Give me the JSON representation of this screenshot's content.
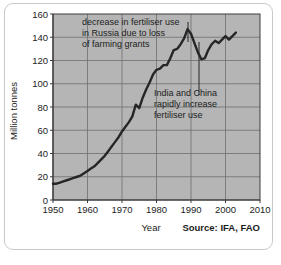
{
  "chart_data": {
    "type": "line",
    "title": "",
    "xlabel": "Year",
    "ylabel": "Million tonnes",
    "source": "Source: IFA, FAO",
    "xlim": [
      1950,
      2010
    ],
    "ylim": [
      0,
      160
    ],
    "grid": true,
    "legend": "none",
    "x_ticks": [
      "1950",
      "1960",
      "1970",
      "1980",
      "1990",
      "2000",
      "2010"
    ],
    "y_ticks": [
      "0",
      "20",
      "40",
      "60",
      "80",
      "100",
      "120",
      "140",
      "160"
    ],
    "series": [
      {
        "name": "World fertiliser use",
        "color": "#262626",
        "x": [
          1950,
          1951,
          1952,
          1953,
          1954,
          1955,
          1956,
          1957,
          1958,
          1959,
          1960,
          1961,
          1962,
          1963,
          1964,
          1965,
          1966,
          1967,
          1968,
          1969,
          1970,
          1971,
          1972,
          1973,
          1974,
          1975,
          1976,
          1977,
          1978,
          1979,
          1980,
          1981,
          1982,
          1983,
          1984,
          1985,
          1986,
          1987,
          1988,
          1989,
          1990,
          1991,
          1992,
          1993,
          1994,
          1995,
          1996,
          1997,
          1998,
          1999,
          2000,
          2001,
          2002,
          2003
        ],
        "values": [
          14,
          14,
          15,
          16,
          17,
          18,
          19,
          20,
          21,
          23,
          25,
          27,
          29,
          32,
          35,
          38,
          42,
          46,
          50,
          54,
          59,
          63,
          67,
          72,
          82,
          79,
          88,
          95,
          101,
          108,
          112,
          113,
          116,
          116,
          122,
          129,
          130,
          134,
          139,
          147,
          143,
          135,
          127,
          121,
          122,
          129,
          134,
          137,
          135,
          138,
          141,
          138,
          141,
          144
        ]
      }
    ],
    "annotations": [
      {
        "id": "russia-annotation",
        "lines": [
          "decrease in fertiliser use",
          "in Russia due to loss",
          "of farming grants"
        ],
        "leader_line": true
      },
      {
        "id": "india-china-annotation",
        "lines": [
          "India and China",
          "rapidly increase",
          "fertiliser use"
        ],
        "leader_line": true
      }
    ],
    "colors": {
      "plot_background": "#b5b5b5",
      "grid": "#6e6e6e",
      "axis": "#3c3c3c",
      "line": "#262626",
      "frame": "#c9c9c9",
      "text": "#1c1c1c"
    }
  }
}
